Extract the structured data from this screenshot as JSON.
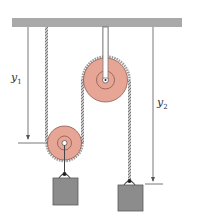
{
  "diagram": {
    "labels": {
      "y1": {
        "base": "y",
        "sub": "1"
      },
      "y2": {
        "base": "y",
        "sub": "2"
      }
    },
    "colors": {
      "ceiling": "#a9a9a9",
      "pulley_fill": "#e7a596",
      "pulley_stroke": "#8a5a50",
      "block_fill": "#8c8c8c",
      "block_stroke": "#5a5a5a",
      "rope": "#9a9a9a",
      "line": "#555555"
    }
  }
}
